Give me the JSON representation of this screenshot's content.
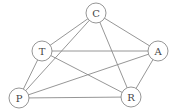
{
  "graph": {
    "nodes": [
      {
        "id": "C",
        "label": "C",
        "x": 96,
        "y": 13
      },
      {
        "id": "T",
        "label": "T",
        "x": 42,
        "y": 51
      },
      {
        "id": "A",
        "label": "A",
        "x": 158,
        "y": 51
      },
      {
        "id": "P",
        "label": "P",
        "x": 19,
        "y": 98
      },
      {
        "id": "R",
        "label": "R",
        "x": 131,
        "y": 97
      }
    ],
    "edges": [
      [
        "C",
        "T"
      ],
      [
        "C",
        "A"
      ],
      [
        "C",
        "P"
      ],
      [
        "C",
        "R"
      ],
      [
        "T",
        "A"
      ],
      [
        "T",
        "P"
      ],
      [
        "T",
        "R"
      ],
      [
        "A",
        "P"
      ],
      [
        "A",
        "R"
      ],
      [
        "P",
        "R"
      ]
    ],
    "node_radius": 10
  }
}
